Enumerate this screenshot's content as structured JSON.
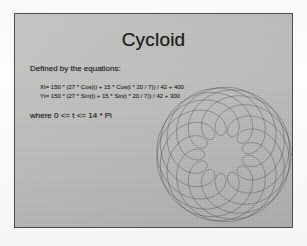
{
  "slide": {
    "title": "Cycloid",
    "intro": "Defined by the equations:",
    "equations": [
      "Xt= 150 * (27 * Cos(t) + 15 * Cos(t * 20 / 7)) / 42 + 400",
      "Yt= 150 * (27 * Sin(t) + 15 * Sin(t * 20 / 7)) / 42 + 300"
    ],
    "domain": "where 0 <= t <= 14 * Pi",
    "colors": {
      "slide_background": "#c2c2c0",
      "slide_border": "#4c4c4c",
      "text": "#1e1e1e",
      "curve_stroke": "#3a3a3a",
      "page_background": "#fdfdfc"
    }
  },
  "chart_data": {
    "type": "line",
    "title": "Cycloid",
    "xlabel": "",
    "ylabel": "",
    "grid": false,
    "legend": null,
    "parametric": {
      "x_expression": "150 * (27 * Cos(t) + 15 * Cos(t * 20 / 7)) / 42 + 400",
      "y_expression": "150 * (27 * Sin(t) + 15 * Sin(t * 20 / 7)) / 42 + 300",
      "R": 27,
      "r": 15,
      "frequency_ratio_numerator": 20,
      "frequency_ratio_denominator": 7,
      "scale": 150,
      "divisor": 42,
      "x_offset": 400,
      "y_offset": 300,
      "t_min": 0,
      "t_max_expression": "14 * Pi",
      "t_max_value": 43.98229715,
      "samples": 2400,
      "petal_count": 14
    },
    "xlim": [
      250,
      550
    ],
    "ylim": [
      150,
      450
    ]
  }
}
